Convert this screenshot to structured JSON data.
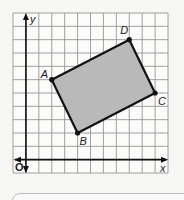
{
  "diagram": {
    "type": "coordinate-plane",
    "axes": {
      "x_label": "x",
      "y_label": "y",
      "origin_label": "O",
      "x_range": [
        -1,
        11
      ],
      "y_range": [
        -1,
        11
      ],
      "grid_step": 1
    },
    "shape": {
      "kind": "rectangle",
      "fill": "#b9b9b9",
      "stroke": "#111111",
      "vertices": [
        {
          "label": "A",
          "x": 2,
          "y": 6
        },
        {
          "label": "B",
          "x": 4,
          "y": 2
        },
        {
          "label": "C",
          "x": 10,
          "y": 5
        },
        {
          "label": "D",
          "x": 8,
          "y": 9
        }
      ]
    }
  },
  "colors": {
    "grid": "#8a8a8a",
    "axis": "#111111",
    "background": "#f6f6f4"
  }
}
